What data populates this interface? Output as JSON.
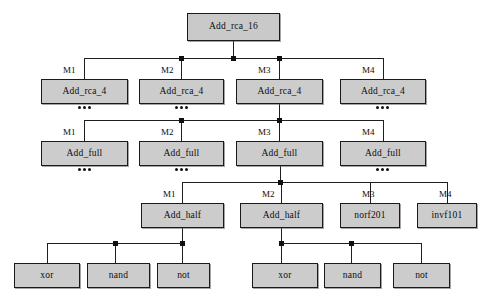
{
  "diagram": {
    "colors": {
      "node_fill": "#cccccc",
      "node_border": "#1a1a1a",
      "wire": "#1f1f1f",
      "background": "#ffffff"
    },
    "levels": [
      {
        "name": "level-0-top",
        "nodes": [
          {
            "label": "Add_rca_16",
            "instance": "",
            "x": 187,
            "y": 13,
            "w": 93,
            "h": 28,
            "ellipsis": false
          }
        ]
      },
      {
        "name": "level-1-rca4",
        "nodes": [
          {
            "label": "Add_rca_4",
            "instance": "M1",
            "x": 41,
            "y": 79,
            "w": 87,
            "h": 25,
            "ellipsis": true
          },
          {
            "label": "Add_rca_4",
            "instance": "M2",
            "x": 139,
            "y": 79,
            "w": 85,
            "h": 25,
            "ellipsis": true
          },
          {
            "label": "Add_rca_4",
            "instance": "M3",
            "x": 236,
            "y": 79,
            "w": 87,
            "h": 25,
            "ellipsis": false
          },
          {
            "label": "Add_rca_4",
            "instance": "M4",
            "x": 340,
            "y": 79,
            "w": 86,
            "h": 25,
            "ellipsis": true
          }
        ]
      },
      {
        "name": "level-2-full",
        "nodes": [
          {
            "label": "Add_full",
            "instance": "M1",
            "x": 41,
            "y": 141,
            "w": 87,
            "h": 25,
            "ellipsis": true
          },
          {
            "label": "Add_full",
            "instance": "M2",
            "x": 139,
            "y": 141,
            "w": 85,
            "h": 25,
            "ellipsis": true
          },
          {
            "label": "Add_full",
            "instance": "M3",
            "x": 236,
            "y": 141,
            "w": 87,
            "h": 25,
            "ellipsis": false
          },
          {
            "label": "Add_full",
            "instance": "M4",
            "x": 340,
            "y": 141,
            "w": 86,
            "h": 25,
            "ellipsis": true
          }
        ]
      },
      {
        "name": "level-3-half",
        "nodes": [
          {
            "label": "Add_half",
            "instance": "M1",
            "x": 141,
            "y": 203,
            "w": 83,
            "h": 25,
            "ellipsis": false
          },
          {
            "label": "Add_half",
            "instance": "M2",
            "x": 240,
            "y": 203,
            "w": 83,
            "h": 25,
            "ellipsis": false
          },
          {
            "label": "norf201",
            "instance": "M3",
            "x": 340,
            "y": 203,
            "w": 60,
            "h": 25,
            "ellipsis": false
          },
          {
            "label": "invf101",
            "instance": "M4",
            "x": 417,
            "y": 203,
            "w": 60,
            "h": 25,
            "ellipsis": false
          }
        ]
      },
      {
        "name": "level-4-gates",
        "nodes": [
          {
            "label": "xor",
            "instance": "",
            "x": 14,
            "y": 263,
            "w": 66,
            "h": 25,
            "ellipsis": false
          },
          {
            "label": "nand",
            "instance": "",
            "x": 87,
            "y": 263,
            "w": 63,
            "h": 25,
            "ellipsis": false
          },
          {
            "label": "not",
            "instance": "",
            "x": 157,
            "y": 263,
            "w": 53,
            "h": 25,
            "ellipsis": false
          },
          {
            "label": "xor",
            "instance": "",
            "x": 252,
            "y": 263,
            "w": 66,
            "h": 25,
            "ellipsis": false
          },
          {
            "label": "nand",
            "instance": "",
            "x": 324,
            "y": 263,
            "w": 57,
            "h": 25,
            "ellipsis": false
          },
          {
            "label": "not",
            "instance": "",
            "x": 393,
            "y": 263,
            "w": 57,
            "h": 25,
            "ellipsis": false
          }
        ]
      }
    ],
    "buses": [
      {
        "name": "bus-top-to-rca4",
        "y": 58,
        "x1": 84,
        "x2": 383
      },
      {
        "name": "bus-rca4-to-full",
        "y": 120,
        "x1": 84,
        "x2": 383
      },
      {
        "name": "bus-full-to-half",
        "y": 182,
        "x1": 182,
        "x2": 447
      },
      {
        "name": "bus-half1-gates",
        "y": 243,
        "x1": 47,
        "x2": 183
      },
      {
        "name": "bus-half2-gates",
        "y": 243,
        "x1": 281,
        "x2": 421
      }
    ],
    "drops": [
      {
        "name": "drop-root-down",
        "x": 233,
        "y1": 41,
        "y2": 58
      },
      {
        "name": "drop-rca4-m1",
        "x": 84,
        "y1": 58,
        "y2": 79
      },
      {
        "name": "drop-rca4-m2",
        "x": 181,
        "y1": 58,
        "y2": 79
      },
      {
        "name": "drop-rca4-m3",
        "x": 279,
        "y1": 58,
        "y2": 79
      },
      {
        "name": "drop-rca4-m4",
        "x": 383,
        "y1": 58,
        "y2": 79
      },
      {
        "name": "drop-rca4m3-down",
        "x": 279,
        "y1": 104,
        "y2": 120
      },
      {
        "name": "drop-full-m1",
        "x": 84,
        "y1": 120,
        "y2": 141
      },
      {
        "name": "drop-full-m2",
        "x": 181,
        "y1": 120,
        "y2": 141
      },
      {
        "name": "drop-full-m3",
        "x": 279,
        "y1": 120,
        "y2": 141
      },
      {
        "name": "drop-full-m4",
        "x": 383,
        "y1": 120,
        "y2": 141
      },
      {
        "name": "drop-fullm3-down",
        "x": 280,
        "y1": 166,
        "y2": 182
      },
      {
        "name": "drop-half-m1",
        "x": 182,
        "y1": 182,
        "y2": 203
      },
      {
        "name": "drop-half-m2",
        "x": 281,
        "y1": 182,
        "y2": 203
      },
      {
        "name": "drop-half-m3",
        "x": 370,
        "y1": 182,
        "y2": 203
      },
      {
        "name": "drop-half-m4",
        "x": 447,
        "y1": 182,
        "y2": 203
      },
      {
        "name": "drop-halfm1-down",
        "x": 182,
        "y1": 228,
        "y2": 243
      },
      {
        "name": "drop-gate-xor-l",
        "x": 47,
        "y1": 243,
        "y2": 263
      },
      {
        "name": "drop-gate-nand-l",
        "x": 115,
        "y1": 243,
        "y2": 263
      },
      {
        "name": "drop-gate-not-l",
        "x": 182,
        "y1": 243,
        "y2": 263
      },
      {
        "name": "drop-halfm2-down",
        "x": 281,
        "y1": 228,
        "y2": 243
      },
      {
        "name": "drop-gate-xor-r",
        "x": 281,
        "y1": 243,
        "y2": 263
      },
      {
        "name": "drop-gate-nand-r",
        "x": 351,
        "y1": 243,
        "y2": 263
      },
      {
        "name": "drop-gate-not-r",
        "x": 421,
        "y1": 243,
        "y2": 263
      }
    ],
    "junctions": [
      {
        "name": "junction-rca4-m2",
        "x": 181,
        "y": 58
      },
      {
        "name": "junction-root",
        "x": 233,
        "y": 58
      },
      {
        "name": "junction-rca4-m3",
        "x": 279,
        "y": 58
      },
      {
        "name": "junction-full-m2",
        "x": 181,
        "y": 120
      },
      {
        "name": "junction-full-m3",
        "x": 279,
        "y": 120
      },
      {
        "name": "junction-half-m2",
        "x": 280,
        "y": 182
      },
      {
        "name": "junction-nand-l",
        "x": 115,
        "y": 243
      },
      {
        "name": "junction-not-l",
        "x": 182,
        "y": 243
      },
      {
        "name": "junction-xor-r",
        "x": 281,
        "y": 243
      },
      {
        "name": "junction-nand-r",
        "x": 351,
        "y": 243
      }
    ]
  }
}
